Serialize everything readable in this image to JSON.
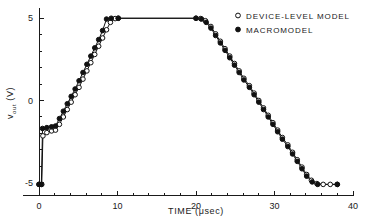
{
  "chart_data": {
    "type": "line",
    "title": "",
    "xlabel": "TIME (μsec)",
    "ylabel": "vₒᵤₜ (V)",
    "ylabel_main": "v",
    "ylabel_sub": "out",
    "ylabel_unit": " (V)",
    "xlim": [
      -2,
      40
    ],
    "ylim": [
      -5.8,
      5.6
    ],
    "xticks": [
      0,
      10,
      20,
      30,
      40
    ],
    "xtick_labels": [
      "0",
      "10",
      "20",
      "30",
      "40"
    ],
    "xtick_minor_step": 2,
    "yticks": [
      -5,
      0,
      5
    ],
    "ytick_labels": [
      "-5",
      "0",
      "5"
    ],
    "ytick_minor_step": 1,
    "grid": false,
    "legend_position": "top-right",
    "series": [
      {
        "name": "DEVICE-LEVEL MODEL",
        "marker": "open-circle",
        "color": "#111111",
        "points": [
          [
            0.0,
            -5.1
          ],
          [
            0.35,
            -5.1
          ],
          [
            0.5,
            -2.15
          ],
          [
            1.0,
            -1.95
          ],
          [
            1.6,
            -1.85
          ],
          [
            2.1,
            -1.8
          ],
          [
            2.6,
            -1.45
          ],
          [
            3.1,
            -1.0
          ],
          [
            3.6,
            -0.55
          ],
          [
            4.1,
            -0.1
          ],
          [
            4.6,
            0.35
          ],
          [
            5.1,
            0.8
          ],
          [
            5.6,
            1.3
          ],
          [
            6.1,
            1.8
          ],
          [
            6.6,
            2.3
          ],
          [
            7.1,
            2.8
          ],
          [
            7.6,
            3.3
          ],
          [
            8.1,
            3.8
          ],
          [
            8.6,
            4.3
          ],
          [
            9.1,
            4.75
          ],
          [
            9.7,
            4.98
          ],
          [
            10.1,
            5.0
          ],
          [
            20.0,
            5.0
          ],
          [
            20.6,
            4.98
          ],
          [
            21.2,
            4.85
          ],
          [
            21.9,
            4.5
          ],
          [
            22.5,
            4.05
          ],
          [
            23.1,
            3.6
          ],
          [
            23.7,
            3.15
          ],
          [
            24.3,
            2.7
          ],
          [
            24.9,
            2.25
          ],
          [
            25.5,
            1.8
          ],
          [
            26.1,
            1.35
          ],
          [
            26.8,
            0.9
          ],
          [
            27.4,
            0.45
          ],
          [
            28.0,
            0.0
          ],
          [
            28.6,
            -0.45
          ],
          [
            29.2,
            -0.9
          ],
          [
            29.8,
            -1.35
          ],
          [
            30.4,
            -1.8
          ],
          [
            31.0,
            -2.25
          ],
          [
            31.7,
            -2.7
          ],
          [
            32.3,
            -3.15
          ],
          [
            32.9,
            -3.6
          ],
          [
            33.5,
            -4.05
          ],
          [
            34.1,
            -4.5
          ],
          [
            34.7,
            -4.85
          ],
          [
            35.4,
            -5.05
          ],
          [
            36.2,
            -5.1
          ],
          [
            37.1,
            -5.1
          ],
          [
            38.0,
            -5.1
          ]
        ]
      },
      {
        "name": "MACROMODEL",
        "marker": "filled-circle",
        "color": "#111111",
        "points": [
          [
            0.0,
            -5.1
          ],
          [
            0.3,
            -5.1
          ],
          [
            0.45,
            -1.7
          ],
          [
            1.0,
            -1.65
          ],
          [
            1.6,
            -1.6
          ],
          [
            2.1,
            -1.55
          ],
          [
            2.6,
            -1.1
          ],
          [
            3.1,
            -0.65
          ],
          [
            3.6,
            -0.2
          ],
          [
            4.1,
            0.25
          ],
          [
            4.6,
            0.7
          ],
          [
            5.1,
            1.2
          ],
          [
            5.6,
            1.7
          ],
          [
            6.1,
            2.2
          ],
          [
            6.6,
            2.7
          ],
          [
            7.1,
            3.2
          ],
          [
            7.6,
            3.7
          ],
          [
            8.1,
            4.25
          ],
          [
            8.6,
            4.95
          ],
          [
            9.2,
            5.0
          ],
          [
            10.1,
            5.0
          ],
          [
            20.0,
            5.0
          ],
          [
            20.7,
            4.95
          ],
          [
            21.3,
            4.75
          ],
          [
            21.9,
            4.4
          ],
          [
            22.5,
            3.95
          ],
          [
            23.1,
            3.5
          ],
          [
            23.7,
            3.05
          ],
          [
            24.3,
            2.6
          ],
          [
            24.9,
            2.15
          ],
          [
            25.5,
            1.7
          ],
          [
            26.1,
            1.25
          ],
          [
            26.8,
            0.8
          ],
          [
            27.4,
            0.35
          ],
          [
            28.0,
            -0.1
          ],
          [
            28.6,
            -0.55
          ],
          [
            29.2,
            -1.0
          ],
          [
            29.8,
            -1.45
          ],
          [
            30.4,
            -1.9
          ],
          [
            31.0,
            -2.35
          ],
          [
            31.7,
            -2.8
          ],
          [
            32.3,
            -3.25
          ],
          [
            32.9,
            -3.7
          ],
          [
            33.5,
            -4.15
          ],
          [
            34.1,
            -4.6
          ],
          [
            34.8,
            -4.95
          ],
          [
            35.5,
            -5.1
          ],
          [
            38.0,
            -5.1
          ]
        ]
      }
    ]
  },
  "legend": {
    "items": [
      {
        "label": "DEVICE-LEVEL MODEL",
        "marker": "open-circle"
      },
      {
        "label": "MACROMODEL",
        "marker": "filled-circle"
      }
    ]
  }
}
